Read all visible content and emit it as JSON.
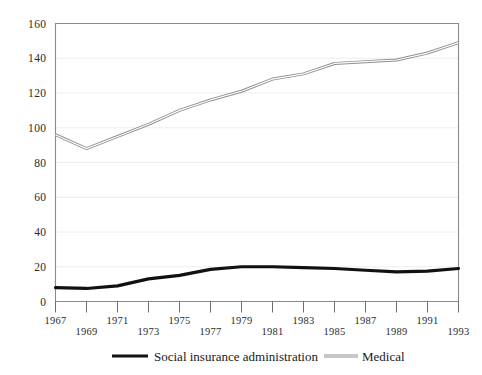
{
  "chart_data": {
    "type": "line",
    "title": "",
    "xlabel": "",
    "ylabel": "",
    "grid": true,
    "legend_position": "bottom",
    "ylim": [
      0,
      160
    ],
    "yticks": [
      0,
      20,
      40,
      60,
      80,
      100,
      120,
      140,
      160
    ],
    "ytick_labels": [
      "0",
      "20",
      "40",
      "60",
      "80",
      "100",
      "120",
      "140",
      "160"
    ],
    "xlim": [
      1967,
      1993
    ],
    "x": [
      1967,
      1969,
      1971,
      1973,
      1975,
      1977,
      1979,
      1981,
      1983,
      1985,
      1987,
      1989,
      1991,
      1993
    ],
    "xticks": [
      1967,
      1969,
      1971,
      1973,
      1975,
      1977,
      1979,
      1981,
      1983,
      1985,
      1987,
      1989,
      1991,
      1993
    ],
    "xtick_labels": [
      "1967",
      "1969",
      "1971",
      "1973",
      "1975",
      "1977",
      "1979",
      "1981",
      "1983",
      "1985",
      "1987",
      "1989",
      "1991",
      "1993"
    ],
    "series": [
      {
        "name": "Social insurance administration",
        "style": "thick-black",
        "color": "#111111",
        "values": [
          8,
          7.5,
          9,
          13,
          15,
          18.5,
          20,
          20,
          19.5,
          19,
          18,
          17,
          17.5,
          19
        ]
      },
      {
        "name": "Medical",
        "style": "double-thin-gray",
        "color": "#8f8f8f",
        "values": [
          96,
          88,
          95,
          102,
          110,
          116,
          121,
          128,
          131,
          137,
          138,
          139,
          143,
          149
        ]
      }
    ]
  },
  "legend": {
    "entries": [
      {
        "label": "Social insurance administration",
        "swatch": "thick-black-line-swatch"
      },
      {
        "label": "Medical",
        "swatch": "double-thin-gray-line-swatch"
      }
    ]
  },
  "colors": {
    "background": "#ffffff",
    "axis": "#8a8a8a",
    "grid": "#ececec",
    "text": "#1a1a1a",
    "series_primary": "#111111",
    "series_secondary": "#8f8f8f"
  }
}
